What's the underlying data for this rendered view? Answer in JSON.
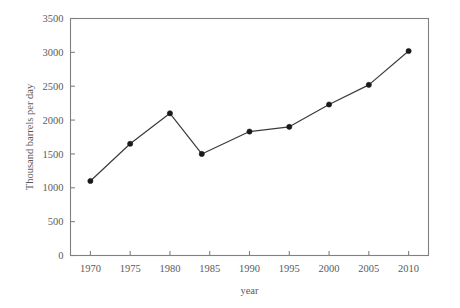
{
  "chart_data": {
    "type": "line",
    "title": "",
    "subtitle": "",
    "xlabel": "year",
    "ylabel": "Thousand barrels per day",
    "xlim": [
      1967.5,
      2012.5
    ],
    "ylim": [
      0,
      3500
    ],
    "xticks": [
      1970,
      1975,
      1980,
      1985,
      1990,
      1995,
      2000,
      2005,
      2010
    ],
    "xtick_labels": [
      "1970",
      "1975",
      "1980",
      "1985",
      "1990",
      "1995",
      "2000",
      "2005",
      "2010"
    ],
    "yticks": [
      0,
      500,
      1000,
      1500,
      2000,
      2500,
      3000,
      3500
    ],
    "ytick_labels": [
      "0",
      "500",
      "1000",
      "1500",
      "2000",
      "2500",
      "3000",
      "3500"
    ],
    "grid": false,
    "legend": false,
    "legend_position": "none",
    "marker": "filled-circle",
    "line_color": "#3b3b3b",
    "marker_color": "#1a1a1a",
    "frame_color": "#808080",
    "text_color": "#5a5a5a",
    "background_color": "#ffffff",
    "series": [
      {
        "name": "Thousand barrels per day",
        "x": [
          1970,
          1975,
          1980,
          1984,
          1990,
          1995,
          2000,
          2005,
          2010
        ],
        "values": [
          1100,
          1650,
          2100,
          1500,
          1830,
          1900,
          2230,
          2520,
          3020
        ]
      }
    ]
  }
}
